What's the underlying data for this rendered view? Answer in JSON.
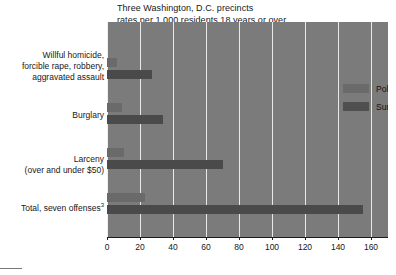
{
  "chart_data": {
    "type": "bar",
    "orientation": "horizontal",
    "title": "Three Washington, D.C. precincts",
    "subtitle": "rates per 1,000 residents 18 years or over",
    "title_lines": [
      "Three Washington, D.C. precincts",
      "rates per 1,000 residents 18 years or over"
    ],
    "xlabel": "",
    "ylabel": "",
    "xlim": [
      0,
      170
    ],
    "xticks": [
      0,
      20,
      40,
      60,
      80,
      100,
      120,
      140,
      160
    ],
    "xtick_labels": [
      "0",
      "20",
      "40",
      "60",
      "80",
      "100",
      "120",
      "140",
      "160"
    ],
    "grid": true,
    "legend_position": "upper right inside plot",
    "categories": [
      "Willful homicide, forcible rape, robbery, aggravated assault",
      "Burglary",
      "Larceny (over and under $50)",
      "Total, seven offenses"
    ],
    "category_label_lines": [
      [
        "Willful homicide,",
        "forcible rape, robbery,",
        "aggravated assault"
      ],
      [
        "Burglary"
      ],
      [
        "Larceny",
        "(over and under $50)"
      ],
      [
        "Total, seven offenses"
      ]
    ],
    "category_footnotes": [
      "",
      "",
      "",
      "3"
    ],
    "series": [
      {
        "name": "Police rate",
        "color": "#6a6a6a",
        "values": [
          6,
          9,
          10,
          23
        ]
      },
      {
        "name": "Survey rate",
        "color": "#4a4a4a",
        "values": [
          27,
          34,
          70,
          155
        ]
      }
    ],
    "plot_background": "#7b7b7b",
    "gridline_color": "#e8e8e8"
  },
  "legend": {
    "items": [
      {
        "label": "Police rate",
        "swatch": "police"
      },
      {
        "label": "Survey rate",
        "swatch": "survey"
      }
    ]
  }
}
